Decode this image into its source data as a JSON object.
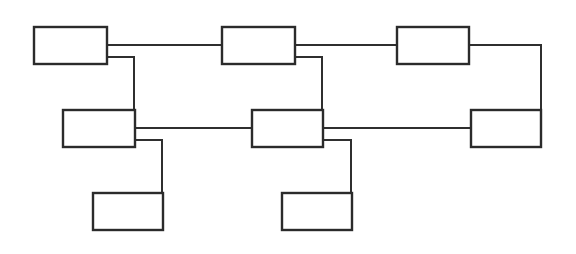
{
  "diagram": {
    "type": "block-diagram",
    "background": "#ffffff",
    "stroke_color": "#2b2b2b",
    "nodes": [
      {
        "id": "A",
        "label": "",
        "x": 34,
        "y": 27,
        "w": 73,
        "h": 37
      },
      {
        "id": "B",
        "label": "",
        "x": 222,
        "y": 27,
        "w": 73,
        "h": 37
      },
      {
        "id": "C",
        "label": "",
        "x": 397,
        "y": 27,
        "w": 72,
        "h": 37
      },
      {
        "id": "D",
        "label": "",
        "x": 63,
        "y": 110,
        "w": 72,
        "h": 37
      },
      {
        "id": "E",
        "label": "",
        "x": 252,
        "y": 110,
        "w": 71,
        "h": 37
      },
      {
        "id": "F",
        "label": "",
        "x": 471,
        "y": 110,
        "w": 70,
        "h": 37
      },
      {
        "id": "G",
        "label": "",
        "x": 93,
        "y": 193,
        "w": 70,
        "h": 37
      },
      {
        "id": "H",
        "label": "",
        "x": 282,
        "y": 193,
        "w": 70,
        "h": 37
      }
    ],
    "edges": [
      {
        "from": "A",
        "to": "B",
        "points": "107,45 222,45"
      },
      {
        "from": "B",
        "to": "C",
        "points": "295,45 397,45"
      },
      {
        "from": "A",
        "to": "D",
        "points": "107,57 134,57 134,110"
      },
      {
        "from": "B",
        "to": "E",
        "points": "295,57 322,57 322,110"
      },
      {
        "from": "C",
        "to": "F",
        "points": "469,45 541,45 541,110"
      },
      {
        "from": "D",
        "to": "E",
        "points": "135,128 252,128"
      },
      {
        "from": "E",
        "to": "F",
        "points": "323,128 471,128"
      },
      {
        "from": "D",
        "to": "G",
        "points": "135,140 162,140 162,193"
      },
      {
        "from": "E",
        "to": "H",
        "points": "323,140 351,140 351,193"
      }
    ]
  }
}
